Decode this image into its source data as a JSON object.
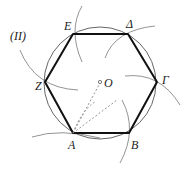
{
  "figure": {
    "label": "(II)",
    "center": {
      "name": "O",
      "x": 100,
      "y": 83
    },
    "circle_radius": 56,
    "vertices": [
      {
        "name": "A",
        "x": 73,
        "y": 133,
        "label_x": 68,
        "label_y": 149
      },
      {
        "name": "B",
        "x": 129,
        "y": 133,
        "label_x": 131,
        "label_y": 149
      },
      {
        "name": "Γ",
        "x": 157,
        "y": 82,
        "label_x": 162,
        "label_y": 84
      },
      {
        "name": "Δ",
        "x": 128,
        "y": 34,
        "label_x": 126,
        "label_y": 28
      },
      {
        "name": "E",
        "x": 73,
        "y": 34,
        "label_x": 64,
        "label_y": 30
      },
      {
        "name": "Z",
        "x": 45,
        "y": 82,
        "label_x": 35,
        "label_y": 90
      }
    ],
    "dashed_segments": [
      {
        "from": "A",
        "to": "O"
      },
      {
        "from": "A",
        "to": "P",
        "px": 117,
        "py": 100
      }
    ],
    "colors": {
      "hexagon": "#111111",
      "circle": "#666666",
      "arcs": "#777777",
      "dashed": "#888888"
    }
  }
}
